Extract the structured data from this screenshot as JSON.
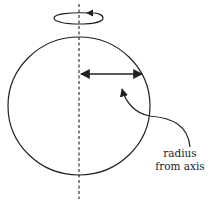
{
  "diagram": {
    "title": "",
    "stroke_color": "#222222",
    "background": "#ffffff",
    "elements": {
      "rotation_indicator": {
        "icon": "rotation-arrow-icon",
        "direction": "counterclockwise (arrow pointing left on top of ellipse)"
      },
      "rotation_axis": {
        "style": "dashed",
        "orientation": "vertical"
      },
      "sphere": {
        "shape": "circle"
      },
      "radius_arrow": {
        "icon": "double-headed-arrow-icon",
        "from": "axis",
        "to": "sphere edge"
      },
      "pointer_arrow": {
        "icon": "curved-arrow-icon",
        "points_to": "radius_arrow"
      }
    },
    "label": {
      "line1": "radius",
      "line2": "from axis"
    }
  }
}
